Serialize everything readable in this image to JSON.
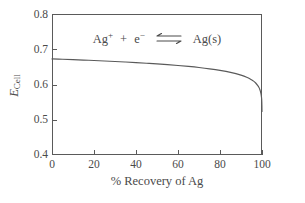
{
  "chart_data": {
    "type": "line",
    "title": "",
    "xlabel": "% Recovery of Ag",
    "ylabel": "E_Cell",
    "ylabel_symbol": "E",
    "ylabel_subscript": "Cell",
    "xlim": [
      0,
      100
    ],
    "ylim": [
      0.4,
      0.8
    ],
    "xticks": [
      0,
      20,
      40,
      60,
      80,
      100
    ],
    "yticks": [
      0.4,
      0.5,
      0.6,
      0.7,
      0.8
    ],
    "xtick_labels": [
      "0",
      "20",
      "40",
      "60",
      "80",
      "100"
    ],
    "ytick_labels": [
      "0.4",
      "0.5",
      "0.6",
      "0.7",
      "0.8"
    ],
    "grid": false,
    "legend": false,
    "annotations": [
      {
        "text": "Ag+ + e-  ⇌  Ag(s)",
        "species_left": "Ag",
        "charge_left": "+",
        "plus": "+",
        "electron": "e",
        "electron_charge": "−",
        "arrow": "⇌",
        "species_right": "Ag(s)",
        "x": 50,
        "y": 0.755
      }
    ],
    "series": [
      {
        "name": "Ecell vs % Recovery",
        "color": "#5a5a5a",
        "x": [
          0,
          5,
          10,
          15,
          20,
          25,
          30,
          35,
          40,
          45,
          50,
          55,
          60,
          65,
          70,
          75,
          80,
          85,
          90,
          93,
          95,
          96,
          97,
          98,
          98.5,
          99,
          99.3,
          99.5,
          99.7,
          99.85,
          99.95,
          100
        ],
        "y": [
          0.6725,
          0.6715,
          0.6705,
          0.6693,
          0.668,
          0.6667,
          0.6653,
          0.6638,
          0.6622,
          0.6604,
          0.6585,
          0.6564,
          0.654,
          0.6513,
          0.6482,
          0.6445,
          0.64,
          0.6343,
          0.6265,
          0.6198,
          0.6135,
          0.6095,
          0.6043,
          0.597,
          0.592,
          0.5852,
          0.5795,
          0.5742,
          0.5665,
          0.558,
          0.5425,
          0.5235
        ]
      }
    ]
  },
  "axis": {
    "line_color": "#5a5a5a",
    "tick_length_px": 5
  }
}
